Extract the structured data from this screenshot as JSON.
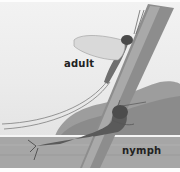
{
  "illustration": {
    "subject": "mayfly life stages",
    "labels": {
      "adult": "adult",
      "nymph": "nymph"
    },
    "colors": {
      "sky": "#ececec",
      "water": "#a8a8a8",
      "hill": "#8a8a8a",
      "stem": "#7a7a7a",
      "wing": "#d8d8d8",
      "label": "#222222"
    }
  }
}
